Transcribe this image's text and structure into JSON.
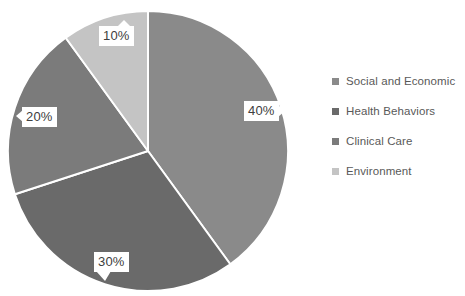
{
  "chart_data": {
    "type": "pie",
    "title": "",
    "categories": [
      "Social and Economic",
      "Health Behaviors",
      "Clinical Care",
      "Environment"
    ],
    "values": [
      40,
      30,
      20,
      10
    ],
    "value_labels": [
      "40%",
      "30%",
      "20%",
      "10%"
    ],
    "unit": "%",
    "colors": [
      "#8a8a8a",
      "#6a6a6a",
      "#7b7b7b",
      "#c4c4c4"
    ],
    "start_angle_deg": 0,
    "direction": "clockwise",
    "slice_border_color": "#ffffff",
    "legend_position": "right",
    "grid": false,
    "background": "#ffffff",
    "slices": [
      {
        "label": "Social and Economic",
        "value": 40,
        "value_label": "40%",
        "color": "#8a8a8a"
      },
      {
        "label": "Health Behaviors",
        "value": 30,
        "value_label": "30%",
        "color": "#6a6a6a"
      },
      {
        "label": "Clinical Care",
        "value": 20,
        "value_label": "20%",
        "color": "#7b7b7b"
      },
      {
        "label": "Environment",
        "value": 10,
        "value_label": "10%",
        "color": "#c4c4c4"
      }
    ]
  },
  "legend": {
    "items": [
      {
        "label": "Social and Economic",
        "color": "#8a8a8a"
      },
      {
        "label": "Health Behaviors",
        "color": "#6a6a6a"
      },
      {
        "label": "Clinical Care",
        "color": "#7b7b7b"
      },
      {
        "label": "Environment",
        "color": "#c4c4c4"
      }
    ]
  }
}
